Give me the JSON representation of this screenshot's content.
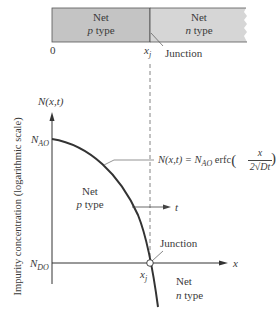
{
  "top_bar": {
    "p_region": {
      "line1": "Net",
      "line2_italic": "p",
      "line2_rest": " type",
      "fill": "#c4c4c4"
    },
    "n_region": {
      "line1": "Net",
      "line2_italic": "n",
      "line2_rest": " type",
      "fill": "#d6d6d6"
    },
    "origin_label": "0",
    "xj_label": "x",
    "xj_sub": "j",
    "junction_label": "Junction"
  },
  "plot": {
    "y_axis_title": "N(x,t)",
    "y_axis_side_label": "Impurity concentration (logarithmic scale)",
    "x_axis_label": "x",
    "nao_label": "N",
    "nao_sub": "AO",
    "ndo_label": "N",
    "ndo_sub": "DO",
    "equation_left": "N(x,t) = N",
    "equation_sub": "AO",
    "equation_mid": " erfc",
    "equation_num": "x",
    "equation_den": "2√Dt",
    "t_arrow_label": "t",
    "p_region": {
      "line1": "Net",
      "line2_italic": "p",
      "line2_rest": " type"
    },
    "n_region": {
      "line1": "Net",
      "line2_italic": "n",
      "line2_rest": " type"
    },
    "junction_label": "Junction",
    "xj_label": "x",
    "xj_sub": "j",
    "curve_color": "#333333"
  }
}
